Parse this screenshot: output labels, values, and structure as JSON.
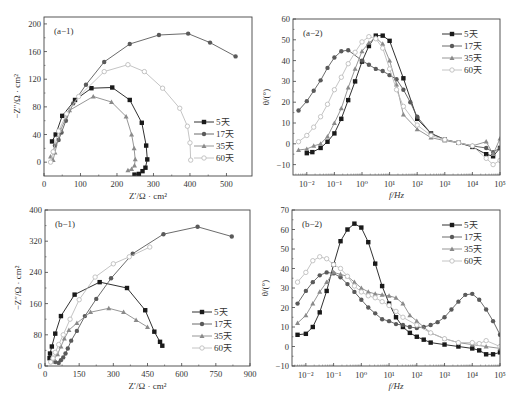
{
  "chart_data": [
    {
      "id": "a-1",
      "type": "scatter",
      "title": "",
      "panel_label": "(a−1)",
      "xlabel": "Z′/Ω · cm²",
      "ylabel": "−Z″/Ω · cm²",
      "xlim": [
        0,
        570
      ],
      "ylim": [
        -20,
        210
      ],
      "xticks": [
        0,
        100,
        200,
        300,
        400,
        500
      ],
      "yticks": [
        0,
        40,
        80,
        120,
        160,
        200
      ],
      "xscale": "linear",
      "grid": false,
      "legend_position": "lower right",
      "frame": {
        "x0": 44,
        "y0": 17,
        "x1": 252,
        "y1": 176
      },
      "series": [
        {
          "name": "5天",
          "marker": "square-filled",
          "color": "#1a1a1a",
          "x": [
            22,
            32,
            50,
            85,
            130,
            187,
            235,
            268,
            280,
            283,
            278,
            270,
            260,
            248
          ],
          "y": [
            30,
            40,
            67,
            90,
            107,
            108,
            90,
            57,
            24,
            4,
            -8,
            -13,
            -17,
            -18
          ]
        },
        {
          "name": "17天",
          "marker": "circle-filled",
          "color": "#5a5a5a",
          "x": [
            25,
            30,
            40,
            48,
            60,
            80,
            115,
            165,
            235,
            315,
            395,
            455,
            525
          ],
          "y": [
            15,
            24,
            32,
            43,
            60,
            85,
            112,
            145,
            171,
            184,
            186,
            173,
            153
          ]
        },
        {
          "name": "35天",
          "marker": "triangle-filled",
          "color": "#8a8a8a",
          "x": [
            18,
            25,
            30,
            45,
            70,
            135,
            185,
            225,
            240,
            247,
            250,
            248,
            240,
            230
          ],
          "y": [
            8,
            3,
            14,
            46,
            75,
            95,
            87,
            66,
            40,
            20,
            4,
            -5,
            -10,
            -12
          ]
        },
        {
          "name": "60天",
          "marker": "circle-open",
          "color": "#bdbdbd",
          "x": [
            18,
            25,
            40,
            62,
            95,
            165,
            230,
            275,
            325,
            372,
            393,
            400,
            402
          ],
          "y": [
            0,
            15,
            45,
            70,
            95,
            131,
            141,
            131,
            107,
            78,
            52,
            28,
            3
          ]
        }
      ]
    },
    {
      "id": "a-2",
      "type": "line",
      "title": "",
      "panel_label": "(a−2)",
      "xlabel": "f/Hz",
      "ylabel": "θ/(°)",
      "xscale": "log",
      "xlim_log10": [
        -2.5,
        5
      ],
      "ylim": [
        -15,
        60
      ],
      "xticks": [
        "10⁻²",
        "10⁻¹",
        "10⁰",
        "10¹",
        "10²",
        "10³",
        "10⁴",
        "10⁵"
      ],
      "yticks": [
        -10,
        0,
        10,
        20,
        30,
        40,
        50,
        60
      ],
      "grid": false,
      "legend_position": "upper right",
      "frame": {
        "x0": 293,
        "y0": 19,
        "x1": 500,
        "y1": 175
      },
      "series": [
        {
          "name": "5天",
          "marker": "square-filled",
          "color": "#1a1a1a",
          "log10_f": [
            -2.0,
            -1.8,
            -1.5,
            -1.25,
            -1.0,
            -0.75,
            -0.5,
            -0.25,
            0.0,
            0.25,
            0.5,
            0.75,
            1.0,
            1.5,
            2.0,
            2.5,
            3.0,
            3.5,
            4.0,
            4.5,
            4.75,
            5.0
          ],
          "theta": [
            -4.5,
            -4,
            -2,
            1,
            5,
            12,
            21,
            30,
            39.5,
            47,
            52,
            52,
            49.5,
            31.5,
            12,
            5,
            2,
            0.5,
            -1.5,
            -5,
            -6,
            -2
          ]
        },
        {
          "name": "17天",
          "marker": "circle-filled",
          "color": "#5a5a5a",
          "log10_f": [
            -2.3,
            -2.0,
            -1.75,
            -1.5,
            -1.25,
            -1.0,
            -0.75,
            -0.5,
            0.0,
            0.25,
            0.5,
            0.75,
            1.0,
            1.25,
            1.5,
            1.75,
            2.0,
            2.5,
            3.0,
            3.5,
            4.0,
            4.5,
            4.75,
            5.0
          ],
          "theta": [
            16,
            20.5,
            25.5,
            30.5,
            36.5,
            41.5,
            44.5,
            45,
            40,
            38,
            36,
            35,
            33,
            31,
            26,
            20,
            13,
            5,
            2,
            0.5,
            -1,
            -2,
            -4,
            -2
          ]
        },
        {
          "name": "35天",
          "marker": "triangle-filled",
          "color": "#8a8a8a",
          "log10_f": [
            -2.3,
            -2.0,
            -1.75,
            -1.5,
            -1.25,
            -1.0,
            -0.75,
            -0.5,
            -0.25,
            0.0,
            0.25,
            0.5,
            0.75,
            1.0,
            1.25,
            1.5,
            2.0,
            2.5,
            3.0,
            3.5,
            4.0,
            4.5,
            4.75,
            5.0
          ],
          "theta": [
            -3,
            -2.5,
            -1,
            0,
            3.5,
            10,
            17,
            27,
            36,
            44.5,
            48.5,
            51,
            48,
            40,
            28.5,
            14,
            7,
            3,
            1.5,
            0.5,
            -1,
            1,
            -5,
            2.5
          ]
        },
        {
          "name": "60天",
          "marker": "circle-open",
          "color": "#bdbdbd",
          "log10_f": [
            -2.3,
            -2.0,
            -1.75,
            -1.5,
            -1.25,
            -1.0,
            -0.75,
            -0.5,
            -0.25,
            0.0,
            0.25,
            0.5,
            0.75,
            1.0,
            1.25,
            1.5,
            2.0,
            2.5,
            3.0,
            3.5,
            4.0,
            4.5,
            4.75,
            5.0
          ],
          "theta": [
            1,
            4,
            8,
            13,
            19,
            26,
            32,
            38.5,
            44,
            49,
            51.5,
            50.5,
            46,
            36,
            26,
            18,
            9,
            4,
            2,
            0.5,
            -1,
            -7,
            -10,
            -8
          ]
        }
      ]
    },
    {
      "id": "b-1",
      "type": "scatter",
      "title": "",
      "panel_label": "(b−1)",
      "xlabel": "Z′/Ω · cm²",
      "ylabel": "−Z″/Ω · cm²",
      "xlim": [
        0,
        900
      ],
      "ylim": [
        0,
        400
      ],
      "xticks": [
        0,
        150,
        300,
        450,
        600,
        750,
        900
      ],
      "yticks": [
        0,
        80,
        160,
        240,
        320,
        400
      ],
      "xscale": "linear",
      "grid": false,
      "legend_position": "lower right",
      "frame": {
        "x0": 45,
        "y0": 210,
        "x1": 250,
        "y1": 366
      },
      "series": [
        {
          "name": "5天",
          "marker": "square-filled",
          "color": "#1a1a1a",
          "x": [
            20,
            22,
            30,
            45,
            70,
            130,
            240,
            360,
            440,
            480,
            505,
            515
          ],
          "y": [
            20,
            32,
            50,
            83,
            128,
            183,
            215,
            200,
            143,
            88,
            62,
            52
          ]
        },
        {
          "name": "17天",
          "marker": "circle-filled",
          "color": "#5a5a5a",
          "x": [
            45,
            60,
            70,
            80,
            90,
            100,
            115,
            140,
            175,
            225,
            290,
            385,
            520,
            670,
            820
          ],
          "y": [
            10,
            8,
            15,
            22,
            32,
            45,
            65,
            90,
            128,
            172,
            225,
            288,
            338,
            357,
            332
          ]
        },
        {
          "name": "35天",
          "marker": "triangle-filled",
          "color": "#8a8a8a",
          "x": [
            30,
            40,
            55,
            70,
            85,
            105,
            140,
            200,
            280,
            345,
            400,
            450
          ],
          "y": [
            12,
            18,
            30,
            50,
            70,
            92,
            110,
            138,
            148,
            138,
            118,
            100
          ]
        },
        {
          "name": "60天",
          "marker": "circle-open",
          "color": "#bdbdbd",
          "x": [
            25,
            35,
            45,
            60,
            80,
            110,
            150,
            220,
            300,
            370,
            460
          ],
          "y": [
            10,
            20,
            35,
            55,
            80,
            120,
            170,
            228,
            262,
            280,
            305
          ]
        }
      ]
    },
    {
      "id": "b-2",
      "type": "line",
      "title": "",
      "panel_label": "(b−2)",
      "xlabel": "f/Hz",
      "ylabel": "θ/(°)",
      "xscale": "log",
      "xlim_log10": [
        -2.5,
        5
      ],
      "ylim": [
        -10,
        70
      ],
      "xticks": [
        "10⁻²",
        "10⁻¹",
        "10⁰",
        "10¹",
        "10²",
        "10³",
        "10⁴",
        "10⁵"
      ],
      "yticks": [
        -10,
        0,
        10,
        20,
        30,
        40,
        50,
        60,
        70
      ],
      "grid": false,
      "legend_position": "upper right",
      "frame": {
        "x0": 292,
        "y0": 210,
        "x1": 500,
        "y1": 366
      },
      "series": [
        {
          "name": "5天",
          "marker": "square-filled",
          "color": "#1a1a1a",
          "log10_f": [
            -2.3,
            -2.0,
            -1.75,
            -1.5,
            -1.25,
            -1.0,
            -0.75,
            -0.5,
            -0.25,
            0.0,
            0.25,
            0.5,
            0.75,
            1.0,
            1.25,
            1.5,
            1.75,
            2.0,
            2.25,
            2.5,
            3.0,
            3.5,
            4.0,
            4.25,
            4.5,
            4.75,
            5.0
          ],
          "theta": [
            6,
            6.5,
            10,
            17.5,
            28.5,
            42,
            54,
            60,
            63,
            61,
            53.5,
            42.5,
            31,
            22,
            15,
            10,
            7,
            5,
            3.5,
            2,
            1,
            0,
            -1,
            -2,
            -4,
            -4,
            -3
          ]
        },
        {
          "name": "17天",
          "marker": "circle-filled",
          "color": "#5a5a5a",
          "log10_f": [
            -2.3,
            -2.0,
            -1.75,
            -1.5,
            -1.25,
            -1.0,
            -0.75,
            -0.5,
            -0.25,
            0.0,
            0.25,
            0.5,
            0.75,
            1.0,
            1.25,
            1.5,
            1.75,
            2.0,
            2.25,
            2.5,
            2.75,
            3.0,
            3.25,
            3.5,
            3.75,
            4.0,
            4.25,
            4.5,
            4.75,
            5.0
          ],
          "theta": [
            22,
            28.5,
            33,
            36.5,
            38,
            37.5,
            35.5,
            32,
            28,
            24,
            20,
            17,
            14,
            13,
            11.5,
            11,
            10,
            9.5,
            10,
            11,
            12.5,
            15,
            19,
            23,
            26.5,
            27,
            24,
            19,
            13,
            6
          ]
        },
        {
          "name": "35天",
          "marker": "triangle-filled",
          "color": "#8a8a8a",
          "log10_f": [
            -2.3,
            -2.0,
            -1.75,
            -1.5,
            -1.25,
            -1.0,
            -0.75,
            -0.5,
            -0.25,
            0.0,
            0.25,
            0.5,
            0.75,
            1.0,
            1.25,
            1.5,
            1.75,
            2.0,
            2.5,
            3.0,
            3.5,
            4.0,
            4.5,
            5.0
          ],
          "theta": [
            12,
            16,
            22,
            28,
            33,
            38,
            37,
            36,
            33,
            30,
            28,
            27,
            26.5,
            26,
            25,
            22,
            16,
            13,
            7,
            4,
            2,
            1,
            0,
            -1
          ]
        },
        {
          "name": "60天",
          "marker": "circle-open",
          "color": "#bdbdbd",
          "log10_f": [
            -2.3,
            -2.0,
            -1.75,
            -1.5,
            -1.25,
            -1.0,
            -0.75,
            -0.5,
            -0.25,
            0.0,
            0.25,
            0.5,
            0.75,
            1.0,
            1.25,
            1.5,
            2.0,
            2.5,
            3.0,
            3.5,
            4.0,
            4.25,
            4.5,
            5.0
          ],
          "theta": [
            33,
            38,
            44,
            46,
            45,
            42,
            40,
            36,
            31,
            28,
            26,
            25,
            23,
            21,
            18,
            15,
            11,
            7,
            4,
            2,
            2,
            1.5,
            3,
            0
          ]
        }
      ]
    }
  ],
  "legend_labels": [
    "5天",
    "17天",
    "35天",
    "60天"
  ],
  "colors": {
    "5天": "#1a1a1a",
    "17天": "#5a5a5a",
    "35天": "#8a8a8a",
    "60天": "#bdbdbd",
    "axis": "#444444"
  }
}
